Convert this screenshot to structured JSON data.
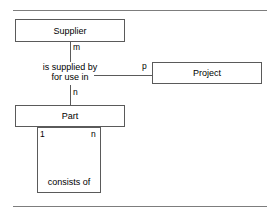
{
  "diagram": {
    "type": "entity-relationship-diagram",
    "entities": [
      {
        "id": "supplier",
        "label": "Supplier"
      },
      {
        "id": "project",
        "label": "Project"
      },
      {
        "id": "part",
        "label": "Part"
      }
    ],
    "relationships": [
      {
        "id": "is-supplied-by-for-use-in",
        "line1": "is supplied by",
        "line2": "for use in"
      },
      {
        "id": "consists-of",
        "label": "consists of"
      }
    ],
    "cardinalities": [
      {
        "id": "supplier-to-rel",
        "label": "m"
      },
      {
        "id": "rel-to-project",
        "label": "p"
      },
      {
        "id": "rel-to-part",
        "label": "n"
      },
      {
        "id": "part-recursive-one",
        "label": "1"
      },
      {
        "id": "part-recursive-many",
        "label": "n"
      }
    ],
    "rules": {
      "top": "horizontal-rule",
      "bottom": "horizontal-rule"
    },
    "colors": {
      "stroke": "#5a5a5a",
      "rule": "#7d7d7d",
      "background": "#ffffff",
      "text": "#000000"
    }
  }
}
